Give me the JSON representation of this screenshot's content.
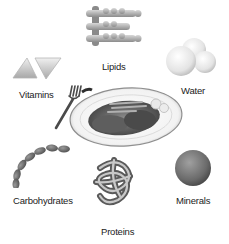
{
  "diagram": {
    "center": {
      "name": "plate-of-food",
      "items": [
        "fork",
        "plate",
        "food"
      ]
    },
    "nutrients": [
      {
        "id": "lipids",
        "label": "Lipids",
        "icon": "lipid-molecule-icon"
      },
      {
        "id": "vitamins",
        "label": "Vitamins",
        "icon": "triangles-icon"
      },
      {
        "id": "water",
        "label": "Water",
        "icon": "water-molecule-icon"
      },
      {
        "id": "carbohydrates",
        "label": "Carbohydrates",
        "icon": "bead-chain-icon"
      },
      {
        "id": "proteins",
        "label": "Proteins",
        "icon": "folded-protein-icon"
      },
      {
        "id": "minerals",
        "label": "Minerals",
        "icon": "sphere-icon"
      }
    ]
  },
  "colors": {
    "background": "#ffffff",
    "label": "#222222",
    "light_gray": "#e6e6e6",
    "mid_gray": "#9a9a9a",
    "dark_gray": "#555555"
  }
}
